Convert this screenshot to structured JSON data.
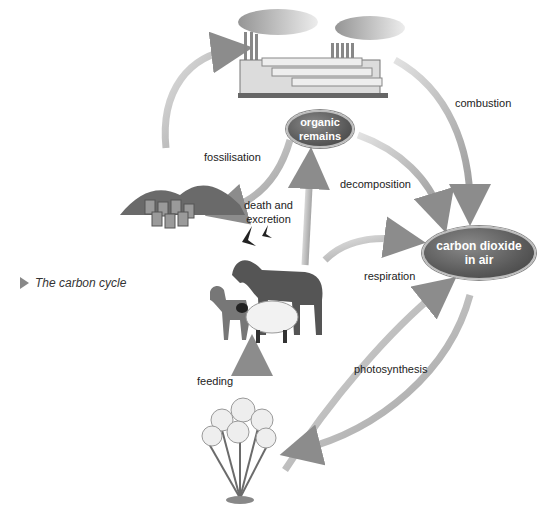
{
  "caption": {
    "text": "The carbon cycle",
    "icon": "triangle-right-icon"
  },
  "nodes": {
    "organic_remains": "organic\nremains",
    "organic_remains_l1": "organic",
    "organic_remains_l2": "remains",
    "carbon_dioxide_l1": "carbon dioxide",
    "carbon_dioxide_l2": "in air"
  },
  "labels": {
    "combustion": "combustion",
    "fossilisation": "fossilisation",
    "decomposition": "decomposition",
    "death_l1": "death and",
    "death_l2": "excretion",
    "respiration": "respiration",
    "feeding": "feeding",
    "photosynthesis": "photosynthesis"
  },
  "illustrations": [
    "factory",
    "fossil-fuels",
    "birds",
    "horse",
    "dog",
    "sheep",
    "flowers"
  ],
  "colors": {
    "arrow": "#b5b5b5",
    "arrow_dark": "#8c8c8c",
    "node": "#5a5a5a",
    "text": "#222222"
  }
}
